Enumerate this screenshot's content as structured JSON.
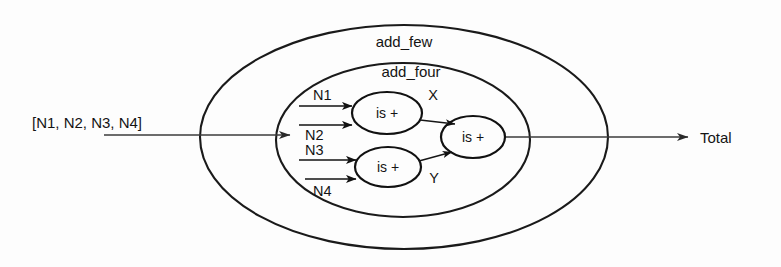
{
  "diagram": {
    "title_hidden": "",
    "style": {
      "stroke": "#1a1a1a",
      "thin_stroke": "#4a4a4a",
      "background": "#fdfdfd",
      "text_color": "#141414"
    },
    "outer_box": {
      "label": "add_few",
      "shape": "ellipse"
    },
    "inner_box": {
      "label": "add_four",
      "shape": "ellipse"
    },
    "nodes": [
      {
        "id": "adder-top",
        "label": "is +",
        "shape": "ellipse"
      },
      {
        "id": "adder-bottom",
        "label": "is +",
        "shape": "ellipse"
      },
      {
        "id": "adder-right",
        "label": "is +",
        "shape": "ellipse"
      }
    ],
    "inputs": [
      {
        "id": "n1",
        "label": "N1"
      },
      {
        "id": "n2",
        "label": "N2"
      },
      {
        "id": "n3",
        "label": "N3"
      },
      {
        "id": "n4",
        "label": "N4"
      }
    ],
    "intermediate_signals": [
      {
        "id": "x",
        "label": "X"
      },
      {
        "id": "y",
        "label": "Y"
      }
    ],
    "external_input": {
      "id": "list-input",
      "label": "[N1, N2, N3, N4]"
    },
    "external_output": {
      "id": "total-output",
      "label": "Total"
    }
  }
}
